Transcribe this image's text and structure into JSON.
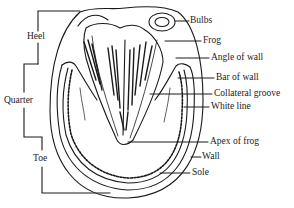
{
  "diagram": {
    "region_labels": [
      {
        "id": "heel",
        "text": "Heel"
      },
      {
        "id": "quarter",
        "text": "Quarter"
      },
      {
        "id": "toe",
        "text": "Toe"
      }
    ],
    "part_labels": [
      {
        "id": "bulbs",
        "text": "Bulbs"
      },
      {
        "id": "frog",
        "text": "Frog"
      },
      {
        "id": "angle-of-wall",
        "text": "Angle of wall"
      },
      {
        "id": "bar-of-wall",
        "text": "Bar of wall"
      },
      {
        "id": "collateral-groove",
        "text": "Collateral groove"
      },
      {
        "id": "white-line",
        "text": "White line"
      },
      {
        "id": "apex-of-frog",
        "text": "Apex of frog"
      },
      {
        "id": "wall",
        "text": "Wall"
      },
      {
        "id": "sole",
        "text": "Sole"
      }
    ],
    "colors": {
      "ink": "#1a1a1a",
      "paper": "#ffffff"
    }
  }
}
